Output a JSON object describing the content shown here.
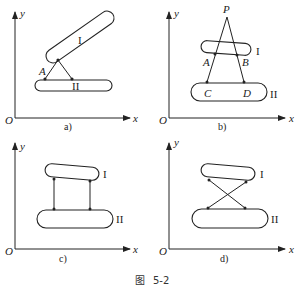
{
  "figure": {
    "caption_prefix": "图",
    "caption_number": "5-2",
    "panels": [
      {
        "id": "a",
        "label": "a)",
        "axis_x": "x",
        "axis_y": "y",
        "origin": "O",
        "body_upper": "I",
        "body_lower": "II",
        "point_labels": [
          "A"
        ]
      },
      {
        "id": "b",
        "label": "b)",
        "axis_x": "x",
        "axis_y": "y",
        "origin": "O",
        "body_upper": "I",
        "body_lower": "II",
        "point_labels": [
          "P",
          "A",
          "B",
          "C",
          "D"
        ]
      },
      {
        "id": "c",
        "label": "c)",
        "axis_x": "x",
        "axis_y": "y",
        "origin": "O",
        "body_upper": "I",
        "body_lower": "II",
        "point_labels": []
      },
      {
        "id": "d",
        "label": "d)",
        "axis_x": "x",
        "axis_y": "y",
        "origin": "O",
        "body_upper": "I",
        "body_lower": "II",
        "point_labels": []
      }
    ]
  }
}
